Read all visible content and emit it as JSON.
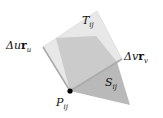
{
  "labels": {
    "T": "T",
    "T_sub": "ij",
    "du": "Δu",
    "du_vec": "r",
    "du_sub": "u",
    "dv": "Δv",
    "dv_vec": "r",
    "dv_sub": "v",
    "S": "S",
    "S_sub": "ij",
    "P": "P",
    "P_sub": "ij"
  },
  "colors": {
    "plane": "#e2e2e2",
    "surface": "#b8b8b8",
    "surface_top": "#cfcfcf",
    "point": "#000000"
  }
}
